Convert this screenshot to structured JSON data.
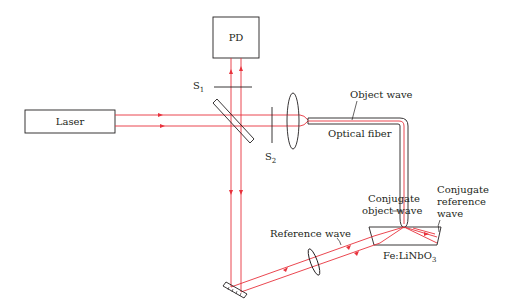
{
  "diagram": {
    "type": "optical-setup",
    "components": {
      "laser": {
        "label": "Laser"
      },
      "photodetector": {
        "label": "PD"
      },
      "shutter_1": {
        "label": "S",
        "subscript": "1"
      },
      "shutter_2": {
        "label": "S",
        "subscript": "2"
      },
      "crystal": {
        "label": "Fe:LiNbO",
        "subscript": "3"
      }
    },
    "annotations": {
      "object_wave": "Object wave",
      "optical_fiber": "Optical fiber",
      "conjugate_object_wave_line1": "Conjugate",
      "conjugate_object_wave_line2": "object wave",
      "conjugate_reference_wave_line1": "Conjugate",
      "conjugate_reference_wave_line2": "reference",
      "conjugate_reference_wave_line3": "wave",
      "reference_wave": "Reference wave"
    },
    "colors": {
      "beam": "#e8323c",
      "outline": "#231f20",
      "background": "#ffffff"
    }
  }
}
